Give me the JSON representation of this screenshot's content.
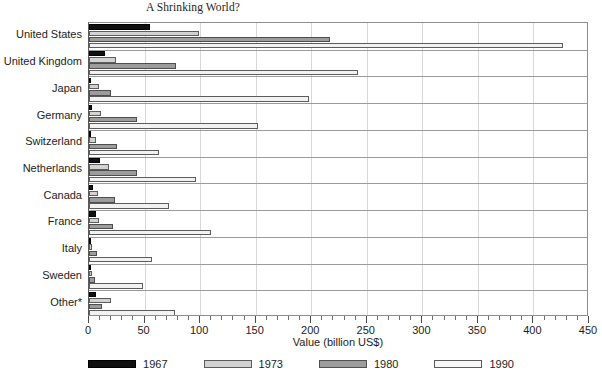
{
  "chart_data": {
    "type": "bar",
    "orientation": "horizontal",
    "title": "A Shrinking World?",
    "xlabel": "Value (billion US$)",
    "ylabel": "",
    "xlim": [
      0,
      450
    ],
    "xticks": [
      0,
      50,
      100,
      150,
      200,
      250,
      300,
      350,
      400,
      450
    ],
    "xtick_labels": [
      "0",
      "50",
      "100",
      "150",
      "200",
      "250",
      "300",
      "350",
      "400",
      "450"
    ],
    "minor_tick_step": 10,
    "grid": "vertical",
    "legend_position": "bottom",
    "categories": [
      "United States",
      "United Kingdom",
      "Japan",
      "Germany",
      "Switzerland",
      "Netherlands",
      "Canada",
      "France",
      "Italy",
      "Sweden",
      "Other*"
    ],
    "series": [
      {
        "name": "1967",
        "color": "#101010",
        "values": [
          55,
          14,
          2,
          3,
          2,
          10,
          4,
          6,
          1,
          2,
          6
        ]
      },
      {
        "name": "1973",
        "color": "#d2d2d2",
        "values": [
          99,
          24,
          9,
          11,
          6,
          18,
          8,
          9,
          3,
          3,
          20
        ]
      },
      {
        "name": "1980",
        "color": "#9c9c9c",
        "values": [
          217,
          78,
          20,
          43,
          25,
          43,
          23,
          22,
          7,
          5,
          12
        ]
      },
      {
        "name": "1990",
        "color": "#f2f2f2",
        "values": [
          427,
          242,
          198,
          152,
          63,
          96,
          72,
          110,
          57,
          49,
          77
        ]
      }
    ]
  },
  "legend": {
    "entries": [
      {
        "label": "1967"
      },
      {
        "label": "1973"
      },
      {
        "label": "1980"
      },
      {
        "label": "1990"
      }
    ]
  }
}
